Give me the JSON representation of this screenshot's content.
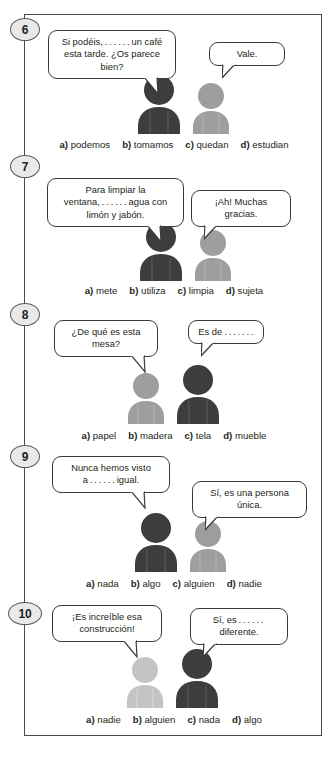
{
  "exercise": {
    "colors": {
      "dark_figure": "#3d3d3d",
      "light_figure": "#9e9e9e",
      "frame_border": "#4a4a4a",
      "badge_fill": "#e9e9e9",
      "badge_border": "#58585a",
      "text": "#231f20"
    },
    "items": [
      {
        "number": "6",
        "bubbles": [
          {
            "text": "Si podéis, . . . . . . un café esta tarde. ¿Os parece bien?"
          },
          {
            "text": "Vale."
          }
        ],
        "figures": [
          {
            "tone": "dark"
          },
          {
            "tone": "light"
          }
        ],
        "options": [
          {
            "letter": "a)",
            "word": "podemos"
          },
          {
            "letter": "b)",
            "word": "tomamos"
          },
          {
            "letter": "c)",
            "word": "quedan"
          },
          {
            "letter": "d)",
            "word": "estudian"
          }
        ]
      },
      {
        "number": "7",
        "bubbles": [
          {
            "text": "Para limpiar la ventana, . . . . . . agua con limón y jabón."
          },
          {
            "text": "¡Ah! Muchas gracias."
          }
        ],
        "figures": [
          {
            "tone": "dark"
          },
          {
            "tone": "light"
          }
        ],
        "options": [
          {
            "letter": "a)",
            "word": "mete"
          },
          {
            "letter": "b)",
            "word": "utiliza"
          },
          {
            "letter": "c)",
            "word": "limpia"
          },
          {
            "letter": "d)",
            "word": "sujeta"
          }
        ]
      },
      {
        "number": "8",
        "bubbles": [
          {
            "text": "¿De qué es esta mesa?"
          },
          {
            "text": "Es de . . . . . . ."
          }
        ],
        "figures": [
          {
            "tone": "light"
          },
          {
            "tone": "dark"
          }
        ],
        "options": [
          {
            "letter": "a)",
            "word": "papel"
          },
          {
            "letter": "b)",
            "word": "madera"
          },
          {
            "letter": "c)",
            "word": "tela"
          },
          {
            "letter": "d)",
            "word": "mueble"
          }
        ]
      },
      {
        "number": "9",
        "bubbles": [
          {
            "text": "Nunca hemos visto a . . . . . . igual."
          },
          {
            "text": "Sí, es una persona única."
          }
        ],
        "figures": [
          {
            "tone": "dark"
          },
          {
            "tone": "light"
          }
        ],
        "options": [
          {
            "letter": "a)",
            "word": "nada"
          },
          {
            "letter": "b)",
            "word": "algo"
          },
          {
            "letter": "c)",
            "word": "alguien"
          },
          {
            "letter": "d)",
            "word": "nadie"
          }
        ]
      },
      {
        "number": "10",
        "bubbles": [
          {
            "text": "¡Es increíble esa construcción!"
          },
          {
            "text": "Sí, es . . . . . .  diferente."
          }
        ],
        "figures": [
          {
            "tone": "light"
          },
          {
            "tone": "dark"
          }
        ],
        "options": [
          {
            "letter": "a)",
            "word": "nadie"
          },
          {
            "letter": "b)",
            "word": "alguien"
          },
          {
            "letter": "c)",
            "word": "nada"
          },
          {
            "letter": "d)",
            "word": "algo"
          }
        ]
      }
    ]
  }
}
